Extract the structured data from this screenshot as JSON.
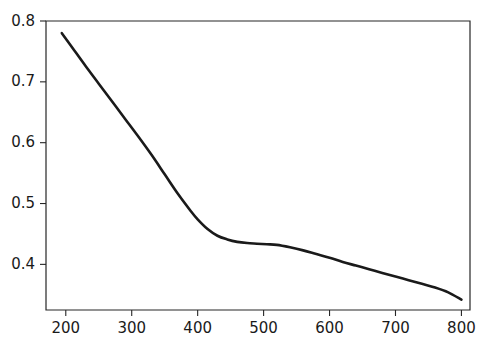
{
  "chart_data": {
    "type": "line",
    "title": "",
    "subtitle": "",
    "xlabel": "",
    "ylabel": "",
    "xlim": [
      170,
      813
    ],
    "ylim": [
      0.325,
      0.8
    ],
    "grid": false,
    "legend": null,
    "annotations": [],
    "xticks": [
      200,
      300,
      400,
      500,
      600,
      700,
      800
    ],
    "xticklabels": [
      "200",
      "300",
      "400",
      "500",
      "600",
      "700",
      "800"
    ],
    "yticks": [
      0.4,
      0.5,
      0.6,
      0.7,
      0.8
    ],
    "yticklabels": [
      "0.4",
      "0.5",
      "0.6",
      "0.7",
      "0.8"
    ],
    "series": [
      {
        "name": "curve",
        "color": "#1a1a1a",
        "linewidth": 2.6,
        "x": [
          194,
          210,
          230,
          250,
          270,
          290,
          310,
          330,
          350,
          370,
          390,
          400,
          415,
          430,
          445,
          460,
          475,
          490,
          505,
          520,
          540,
          560,
          580,
          600,
          620,
          640,
          660,
          680,
          700,
          720,
          740,
          760,
          780,
          800
        ],
        "y": [
          0.78,
          0.756,
          0.726,
          0.697,
          0.668,
          0.639,
          0.61,
          0.58,
          0.548,
          0.516,
          0.487,
          0.474,
          0.458,
          0.447,
          0.441,
          0.437,
          0.435,
          0.434,
          0.433,
          0.432,
          0.428,
          0.423,
          0.417,
          0.411,
          0.404,
          0.398,
          0.392,
          0.386,
          0.38,
          0.374,
          0.368,
          0.362,
          0.354,
          0.342
        ]
      }
    ],
    "axes_box": {
      "left_px": 46,
      "right_px": 470,
      "top_px": 21,
      "bottom_px": 310
    },
    "spine_color": "#262626",
    "background_color": "#ffffff",
    "tick_label_color": "#1a1a1a"
  }
}
